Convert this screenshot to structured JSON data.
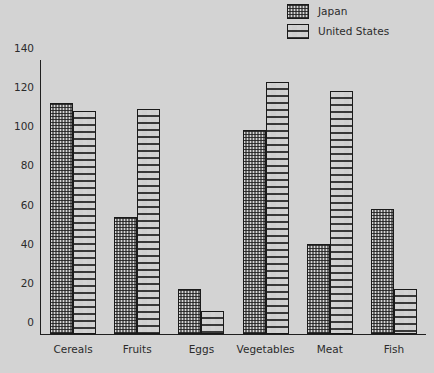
{
  "chart_data": {
    "type": "bar",
    "title": "",
    "xlabel": "",
    "ylabel": "",
    "ylim": [
      0,
      140
    ],
    "yticks": [
      0,
      20,
      40,
      60,
      80,
      100,
      120,
      140
    ],
    "grid": false,
    "legend_position": "top-right",
    "categories": [
      "Cereals",
      "Fruits",
      "Eggs",
      "Vegetables",
      "Meat",
      "Fish"
    ],
    "series": [
      {
        "name": "Japan",
        "values": [
          118,
          60,
          23,
          104,
          46,
          64
        ],
        "color": "#6e6e6e",
        "pattern": "dense-crosshatch"
      },
      {
        "name": "United States",
        "values": [
          114,
          115,
          12,
          129,
          124,
          23
        ],
        "color": "#cfcfcf",
        "pattern": "brick-dash"
      }
    ]
  },
  "legend": {
    "items": [
      {
        "label": "Japan",
        "swatch": "japan-swatch"
      },
      {
        "label": "United States",
        "swatch": "united-states-swatch"
      }
    ]
  },
  "colors": {
    "background": "#d3d3d3",
    "axis": "#1f1f1f",
    "text": "#2b2b2b",
    "japan": "#6e6e6e",
    "united_states": "#cfcfcf"
  }
}
